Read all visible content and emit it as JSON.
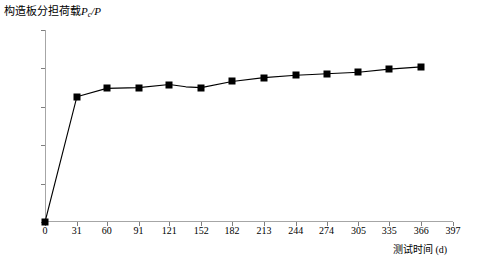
{
  "chart_data": {
    "type": "line",
    "title": "构造板分担荷载Pc/P",
    "title_parts": {
      "main": "构造板分担荷载",
      "var": "P",
      "sub": "c",
      "denom": "/P"
    },
    "xlabel": "测试时间 (d)",
    "ylabel": "",
    "xlim": [
      0,
      397
    ],
    "ylim": [
      0,
      0.25
    ],
    "grid": false,
    "legend": null,
    "ytick_labels": [
      "25.00%",
      "20.00%",
      "15.00%",
      "10.00%",
      "5.00%",
      "0"
    ],
    "ytick_values": [
      0.25,
      0.2,
      0.15,
      0.1,
      0.05,
      0.0
    ],
    "xtick_labels": [
      "0",
      "31",
      "60",
      "91",
      "121",
      "152",
      "182",
      "213",
      "244",
      "274",
      "305",
      "335",
      "366",
      "397"
    ],
    "xtick_values": [
      0,
      31,
      60,
      91,
      121,
      152,
      182,
      213,
      244,
      274,
      305,
      335,
      366,
      397
    ],
    "marker": "square",
    "marker_color": "#000000",
    "line_color": "#000000",
    "x": [
      0,
      31,
      60,
      91,
      121,
      137,
      152,
      182,
      213,
      244,
      260,
      274,
      305,
      335,
      366
    ],
    "values": [
      0.0,
      0.163,
      0.174,
      0.175,
      0.179,
      0.176,
      0.175,
      0.183,
      0.188,
      0.191,
      0.192,
      0.193,
      0.195,
      0.199,
      0.202
    ],
    "value_labels": [
      "0.00%",
      "16.30%",
      "17.40%",
      "17.50%",
      "17.90%",
      "17.60%",
      "17.50%",
      "18.30%",
      "18.80%",
      "19.10%",
      "19.20%",
      "19.30%",
      "19.50%",
      "19.90%",
      "20.20%"
    ]
  }
}
